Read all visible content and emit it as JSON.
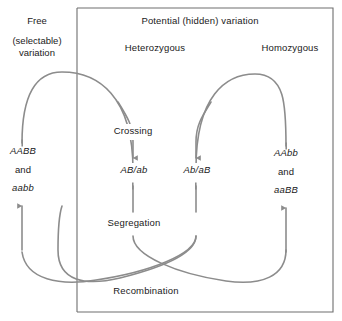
{
  "diagram": {
    "title_region": {
      "potential_label": "Potential  (hidden) variation",
      "heterozygous_label": "Heterozygous",
      "homozygous_label": "Homozygous"
    },
    "free_variation": {
      "line1": "Free",
      "line2": "(selectable)",
      "line3": "variation"
    },
    "genotypes": {
      "left": {
        "top": "AABB",
        "conjunction": "and",
        "bottom": "aabb"
      },
      "center_left": "AB/ab",
      "center_right": "Ab/aB",
      "right": {
        "top": "AAbb",
        "conjunction": "and",
        "bottom": "aaBB"
      }
    },
    "processes": {
      "crossing": "Crossing",
      "segregation": "Segregation",
      "recombination": "Recombination"
    },
    "colors": {
      "arrow": "#8c8c8c",
      "border": "#6e6e6e",
      "text": "#1a1a1a",
      "background": "#ffffff"
    }
  }
}
